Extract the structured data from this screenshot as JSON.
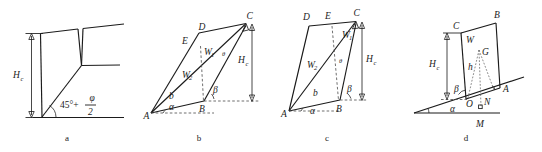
{
  "figure": {
    "width": 542,
    "height": 152,
    "background": "#ffffff",
    "ink_color": "#1b1b1b",
    "dash_color": "#4a4a4a",
    "caption_list": [
      "a",
      "b",
      "c",
      "d"
    ]
  },
  "panels": [
    {
      "id": "a",
      "caption": "a",
      "description": "retaining wall with tension crack and failure plane",
      "labels": {
        "height": "H",
        "height_sub": "c",
        "angle_base": "45°+",
        "angle_numerator": "φ",
        "angle_denominator": "2"
      }
    },
    {
      "id": "b",
      "caption": "b",
      "description": "two-wedge failure mechanism with tension crack, vertices A B C D E",
      "labels": {
        "A": "A",
        "B": "B",
        "C": "C",
        "D": "D",
        "E": "E",
        "W1": "W",
        "W1_sub": "1",
        "W2": "W",
        "W2_sub": "2",
        "b": "b",
        "alpha": "α",
        "beta": "β",
        "theta": "θ",
        "height": "H",
        "height_sub": "c"
      }
    },
    {
      "id": "c",
      "caption": "c",
      "description": "two-wedge failure mechanism, vertices A B C D E with vertical split",
      "labels": {
        "A": "A",
        "B": "B",
        "C": "C",
        "D": "D",
        "E": "E",
        "W1": "W",
        "W1_sub": "1",
        "W2": "W",
        "W2_sub": "2",
        "b": "b",
        "alpha": "α",
        "beta": "β",
        "theta": "θ",
        "height": "H",
        "height_sub": "c"
      }
    },
    {
      "id": "d",
      "caption": "d",
      "description": "sliding block on inclined plane with weight W and centroid G",
      "labels": {
        "A": "A",
        "B": "B",
        "C": "C",
        "G": "G",
        "M": "M",
        "N": "N",
        "O": "O",
        "W": "W",
        "h": "h",
        "alpha": "α",
        "beta": "β",
        "height": "H",
        "height_sub": "c"
      }
    }
  ]
}
